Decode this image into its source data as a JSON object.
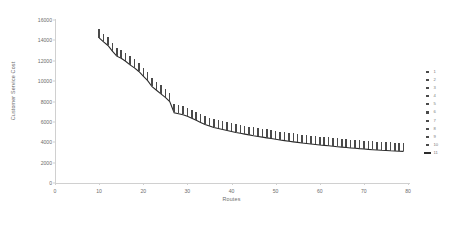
{
  "chart_data": {
    "type": "scatter",
    "title": "",
    "xlabel": "Routes",
    "ylabel": "Customer Service Cost",
    "xlim": [
      0,
      80
    ],
    "ylim": [
      0,
      16000
    ],
    "xticks": [
      0,
      10,
      20,
      30,
      40,
      50,
      60,
      70,
      80
    ],
    "yticks": [
      0,
      2000,
      4000,
      6000,
      8000,
      10000,
      12000,
      14000,
      16000
    ],
    "grid": false,
    "legend_position": "right",
    "legend": [
      "1",
      "2",
      "3",
      "4",
      "5",
      "6",
      "7",
      "8",
      "9",
      "10",
      "11"
    ],
    "marker_color": "#4a4a4a",
    "line_color": "#2b2b2b",
    "axis_color": "#d0d0d0",
    "text_color": "#6d6d6d",
    "note": "Ten scatter series of repeated trials at each route count plus an eleventh line series tracing the best (minimum) cost envelope.",
    "x": [
      10,
      11,
      12,
      13,
      14,
      15,
      16,
      17,
      18,
      19,
      20,
      21,
      22,
      23,
      24,
      25,
      26,
      27,
      28,
      29,
      30,
      31,
      32,
      33,
      34,
      35,
      36,
      37,
      38,
      39,
      40,
      41,
      42,
      43,
      44,
      45,
      46,
      47,
      48,
      49,
      50,
      51,
      52,
      53,
      54,
      55,
      56,
      57,
      58,
      59,
      60,
      61,
      62,
      63,
      64,
      65,
      66,
      67,
      68,
      69,
      70,
      71,
      72,
      73,
      74,
      75,
      76,
      77,
      78,
      79
    ],
    "series": [
      {
        "name": "11",
        "type": "line",
        "label": "best-cost envelope",
        "values": [
          14250,
          13850,
          13500,
          12950,
          12450,
          12250,
          11950,
          11600,
          11300,
          10950,
          10500,
          10050,
          9450,
          9100,
          8750,
          8400,
          8000,
          6900,
          6800,
          6700,
          6550,
          6350,
          6150,
          5950,
          5750,
          5600,
          5450,
          5350,
          5250,
          5150,
          5050,
          4950,
          4880,
          4800,
          4720,
          4640,
          4570,
          4500,
          4430,
          4360,
          4290,
          4220,
          4160,
          4100,
          4040,
          3990,
          3930,
          3880,
          3830,
          3780,
          3730,
          3690,
          3650,
          3600,
          3560,
          3520,
          3480,
          3440,
          3410,
          3370,
          3340,
          3300,
          3270,
          3240,
          3210,
          3190,
          3160,
          3140,
          3120,
          3100
        ]
      },
      {
        "name": "1",
        "type": "scatter",
        "values": [
          14400,
          14000,
          13650,
          13100,
          12600,
          12400,
          12100,
          11750,
          11450,
          11100,
          10650,
          10200,
          9600,
          9250,
          8900,
          8550,
          8150,
          7050,
          6950,
          6850,
          6700,
          6500,
          6300,
          6100,
          5900,
          5750,
          5600,
          5500,
          5400,
          5300,
          5200,
          5100,
          5030,
          4950,
          4870,
          4790,
          4720,
          4650,
          4580,
          4510,
          4440,
          4370,
          4310,
          4250,
          4190,
          4140,
          4080,
          4030,
          3980,
          3930,
          3880,
          3840,
          3800,
          3750,
          3710,
          3670,
          3630,
          3590,
          3560,
          3520,
          3490,
          3450,
          3420,
          3390,
          3360,
          3340,
          3310,
          3290,
          3270,
          3250
        ]
      },
      {
        "name": "2",
        "type": "scatter",
        "values": [
          14550,
          14150,
          13800,
          13250,
          12750,
          12550,
          12250,
          11900,
          11600,
          11250,
          10800,
          10350,
          9750,
          9400,
          9050,
          8700,
          8300,
          7200,
          7100,
          7000,
          6850,
          6650,
          6450,
          6250,
          6050,
          5900,
          5750,
          5650,
          5550,
          5450,
          5350,
          5250,
          5180,
          5100,
          5020,
          4940,
          4870,
          4800,
          4730,
          4660,
          4590,
          4520,
          4460,
          4400,
          4340,
          4290,
          4230,
          4180,
          4130,
          4080,
          4030,
          3990,
          3950,
          3900,
          3860,
          3820,
          3780,
          3740,
          3710,
          3670,
          3640,
          3600,
          3570,
          3540,
          3510,
          3490,
          3460,
          3440,
          3420,
          3400
        ]
      },
      {
        "name": "3",
        "type": "scatter",
        "values": [
          14700,
          14300,
          13950,
          13400,
          12900,
          12700,
          12400,
          12050,
          11750,
          11400,
          10950,
          10500,
          9900,
          9550,
          9200,
          8850,
          8450,
          7350,
          7250,
          7150,
          7000,
          6800,
          6600,
          6400,
          6200,
          6050,
          5900,
          5800,
          5700,
          5600,
          5500,
          5400,
          5330,
          5250,
          5170,
          5090,
          5020,
          4950,
          4880,
          4810,
          4740,
          4670,
          4610,
          4550,
          4490,
          4440,
          4380,
          4330,
          4280,
          4230,
          4180,
          4140,
          4100,
          4050,
          4010,
          3970,
          3930,
          3890,
          3860,
          3820,
          3790,
          3750,
          3720,
          3690,
          3660,
          3640,
          3610,
          3590,
          3570,
          3550
        ]
      },
      {
        "name": "4",
        "type": "scatter",
        "values": [
          14850,
          14450,
          14100,
          13550,
          13050,
          12850,
          12550,
          12200,
          11900,
          11550,
          11100,
          10650,
          10050,
          9700,
          9350,
          9000,
          8600,
          7500,
          7400,
          7300,
          7150,
          6950,
          6750,
          6550,
          6350,
          6200,
          6050,
          5950,
          5850,
          5750,
          5650,
          5550,
          5480,
          5400,
          5320,
          5240,
          5170,
          5100,
          5030,
          4960,
          4890,
          4820,
          4760,
          4700,
          4640,
          4590,
          4530,
          4480,
          4430,
          4380,
          4330,
          4290,
          4250,
          4200,
          4160,
          4120,
          4080,
          4040,
          4010,
          3970,
          3940,
          3900,
          3870,
          3840,
          3810,
          3790,
          3760,
          3740,
          3720,
          3700
        ]
      },
      {
        "name": "5",
        "type": "scatter",
        "values": [
          14950,
          14550,
          14200,
          13650,
          13150,
          12950,
          12650,
          12300,
          12000,
          11650,
          11200,
          10750,
          10150,
          9800,
          9450,
          9100,
          8700,
          7600,
          7500,
          7400,
          7250,
          7050,
          6850,
          6650,
          6450,
          6300,
          6150,
          6050,
          5950,
          5850,
          5750,
          5650,
          5580,
          5500,
          5420,
          5340,
          5270,
          5200,
          5130,
          5060,
          4990,
          4920,
          4860,
          4800,
          4740,
          4690,
          4630,
          4580,
          4530,
          4480,
          4430,
          4390,
          4350,
          4300,
          4260,
          4220,
          4180,
          4140,
          4110,
          4070,
          4040,
          4000,
          3970,
          3940,
          3910,
          3890,
          3860,
          3840,
          3820,
          3800
        ]
      },
      {
        "name": "6",
        "type": "scatter",
        "values": [
          14500,
          14100,
          13750,
          13200,
          12700,
          12500,
          12200,
          11850,
          11550,
          11200,
          10750,
          10300,
          9700,
          9350,
          9000,
          8650,
          8250,
          7150,
          7050,
          6950,
          6800,
          6600,
          6400,
          6200,
          6000,
          5850,
          5700,
          5600,
          5500,
          5400,
          5300,
          5200,
          5130,
          5050,
          4970,
          4890,
          4820,
          4750,
          4680,
          4610,
          4540,
          4470,
          4410,
          4350,
          4290,
          4240,
          4180,
          4130,
          4080,
          4030,
          3980,
          3940,
          3900,
          3850,
          3810,
          3770,
          3730,
          3690,
          3660,
          3620,
          3590,
          3550,
          3520,
          3490,
          3460,
          3440,
          3410,
          3390,
          3370,
          3350
        ]
      },
      {
        "name": "7",
        "type": "scatter",
        "values": [
          14650,
          14250,
          13900,
          13350,
          12850,
          12650,
          12350,
          12000,
          11700,
          11350,
          10900,
          10450,
          9850,
          9500,
          9150,
          8800,
          8400,
          7300,
          7200,
          7100,
          6950,
          6750,
          6550,
          6350,
          6150,
          6000,
          5850,
          5750,
          5650,
          5550,
          5450,
          5350,
          5280,
          5200,
          5120,
          5040,
          4970,
          4900,
          4830,
          4760,
          4690,
          4620,
          4560,
          4500,
          4440,
          4390,
          4330,
          4280,
          4230,
          4180,
          4130,
          4090,
          4050,
          4000,
          3960,
          3920,
          3880,
          3840,
          3810,
          3770,
          3740,
          3700,
          3670,
          3640,
          3610,
          3590,
          3560,
          3540,
          3520,
          3500
        ]
      },
      {
        "name": "8",
        "type": "scatter",
        "values": [
          14800,
          14400,
          14050,
          13500,
          13000,
          12800,
          12500,
          12150,
          11850,
          11500,
          11050,
          10600,
          10000,
          9650,
          9300,
          8950,
          8550,
          7450,
          7350,
          7250,
          7100,
          6900,
          6700,
          6500,
          6300,
          6150,
          6000,
          5900,
          5800,
          5700,
          5600,
          5500,
          5430,
          5350,
          5270,
          5190,
          5120,
          5050,
          4980,
          4910,
          4840,
          4770,
          4710,
          4650,
          4590,
          4540,
          4480,
          4430,
          4380,
          4330,
          4280,
          4240,
          4200,
          4150,
          4110,
          4070,
          4030,
          3990,
          3960,
          3920,
          3890,
          3850,
          3820,
          3790,
          3760,
          3740,
          3710,
          3690,
          3670,
          3650
        ]
      },
      {
        "name": "9",
        "type": "scatter",
        "values": [
          14350,
          13950,
          13600,
          13050,
          12550,
          12350,
          12050,
          11700,
          11400,
          11050,
          10600,
          10150,
          9550,
          9200,
          8850,
          8500,
          8100,
          7000,
          6900,
          6800,
          6650,
          6450,
          6250,
          6050,
          5850,
          5700,
          5550,
          5450,
          5350,
          5250,
          5150,
          5050,
          4980,
          4900,
          4820,
          4740,
          4670,
          4600,
          4530,
          4460,
          4390,
          4320,
          4260,
          4200,
          4140,
          4090,
          4030,
          3980,
          3930,
          3880,
          3830,
          3790,
          3750,
          3700,
          3660,
          3620,
          3580,
          3540,
          3510,
          3470,
          3440,
          3400,
          3370,
          3340,
          3310,
          3290,
          3260,
          3240,
          3220,
          3200
        ]
      },
      {
        "name": "10",
        "type": "scatter",
        "values": [
          15000,
          14600,
          14250,
          13700,
          13200,
          13000,
          12700,
          12350,
          12050,
          11700,
          11250,
          10800,
          10200,
          9850,
          9500,
          9150,
          8750,
          7650,
          7550,
          7450,
          7300,
          7100,
          6900,
          6700,
          6500,
          6350,
          6200,
          6100,
          6000,
          5900,
          5800,
          5700,
          5630,
          5550,
          5470,
          5390,
          5320,
          5250,
          5180,
          5110,
          5040,
          4970,
          4910,
          4850,
          4790,
          4740,
          4680,
          4630,
          4580,
          4530,
          4480,
          4440,
          4400,
          4350,
          4310,
          4270,
          4230,
          4190,
          4160,
          4120,
          4090,
          4050,
          4020,
          3990,
          3960,
          3940,
          3910,
          3890,
          3870,
          3850
        ]
      }
    ]
  }
}
